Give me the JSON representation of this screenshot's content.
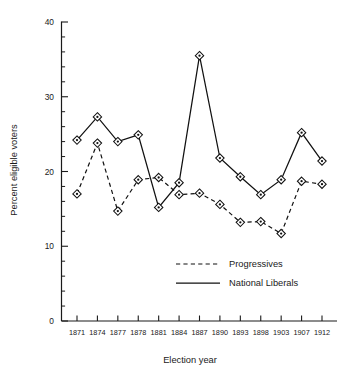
{
  "chart_data": {
    "type": "line",
    "title": "",
    "xlabel": "Election year",
    "ylabel": "Percent eligible voters",
    "categories": [
      "1871",
      "1874",
      "1877",
      "1878",
      "1881",
      "1884",
      "1887",
      "1890",
      "1893",
      "1898",
      "1903",
      "1907",
      "1912"
    ],
    "ylim": [
      0,
      40
    ],
    "yticks": [
      0,
      10,
      20,
      30,
      40
    ],
    "ytick_labels": [
      "0",
      "10",
      "20",
      "30",
      "40"
    ],
    "yminor_step": 2,
    "grid": false,
    "legend_position": "inside-lower-right",
    "series": [
      {
        "name": "Progressives",
        "style": "dashed",
        "marker": "diamond",
        "values": [
          17.0,
          23.8,
          14.7,
          18.9,
          19.2,
          16.9,
          17.1,
          15.6,
          13.2,
          13.3,
          11.7,
          18.7,
          18.3
        ]
      },
      {
        "name": "National Liberals",
        "style": "solid",
        "marker": "diamond",
        "values": [
          24.2,
          27.3,
          24.0,
          24.9,
          15.2,
          18.5,
          35.5,
          21.8,
          19.3,
          16.9,
          18.9,
          25.2,
          21.4
        ]
      }
    ]
  },
  "axes": {
    "y_title": "Percent eligible voters",
    "x_title": "Election year"
  },
  "legend": {
    "entries": [
      {
        "label": "Progressives",
        "style": "dashed"
      },
      {
        "label": "National Liberals",
        "style": "solid"
      }
    ]
  },
  "colors": {
    "ink": "#111111",
    "background": "#ffffff"
  }
}
